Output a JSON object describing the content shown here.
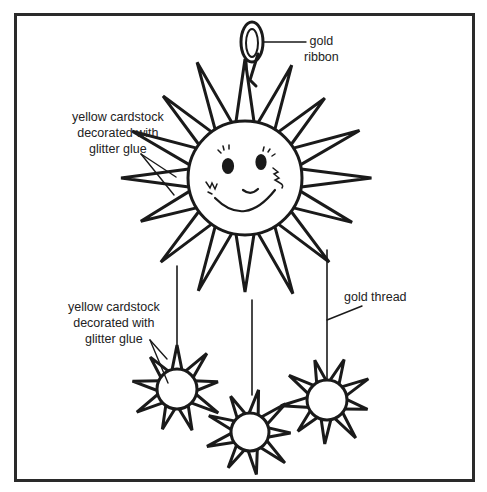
{
  "diagram": {
    "labels": {
      "ribbon": [
        "gold",
        "ribbon"
      ],
      "main_sun": [
        "yellow cardstock",
        "decorated with",
        "glitter glue"
      ],
      "small_suns": [
        "yellow cardstock",
        "decorated with",
        "glitter glue"
      ],
      "thread": "gold thread"
    },
    "parts": [
      {
        "name": "gold ribbon loop",
        "cx": 252,
        "cy": 40
      },
      {
        "name": "main sun",
        "cx": 245,
        "cy": 178,
        "radius": 57,
        "rays": 16
      },
      {
        "name": "small sun left",
        "cx": 177,
        "cy": 389,
        "radius": 20,
        "rays": 9
      },
      {
        "name": "small sun middle",
        "cx": 250,
        "cy": 432,
        "radius": 19,
        "rays": 9
      },
      {
        "name": "small sun right",
        "cx": 327,
        "cy": 400,
        "radius": 20,
        "rays": 9
      }
    ],
    "colors": {
      "ink": "#1a1a1a",
      "frame": "#2a2a2a",
      "background": "#ffffff"
    }
  }
}
